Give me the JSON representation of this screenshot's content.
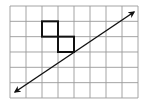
{
  "diagram": {
    "type": "grid-with-line",
    "grid": {
      "columns": 8,
      "rows": 6,
      "origin_px": [
        10,
        6
      ],
      "cell_width_px": 16,
      "cell_height_px": 15.33,
      "line_color": "#9a9a9a",
      "border_color": "#9a9a9a"
    },
    "shaded_squares": [
      {
        "col": 2,
        "row": 1,
        "stroke": "#111111"
      },
      {
        "col": 3,
        "row": 2,
        "stroke": "#111111"
      }
    ],
    "line": {
      "description": "double-headed arrow",
      "from_px": [
        15,
        92
      ],
      "to_px": [
        134,
        12
      ],
      "color": "#111111",
      "arrowheads": [
        "start",
        "end"
      ]
    },
    "colors": {
      "background": "#ffffff",
      "grid": "#9a9a9a",
      "ink": "#111111"
    }
  }
}
